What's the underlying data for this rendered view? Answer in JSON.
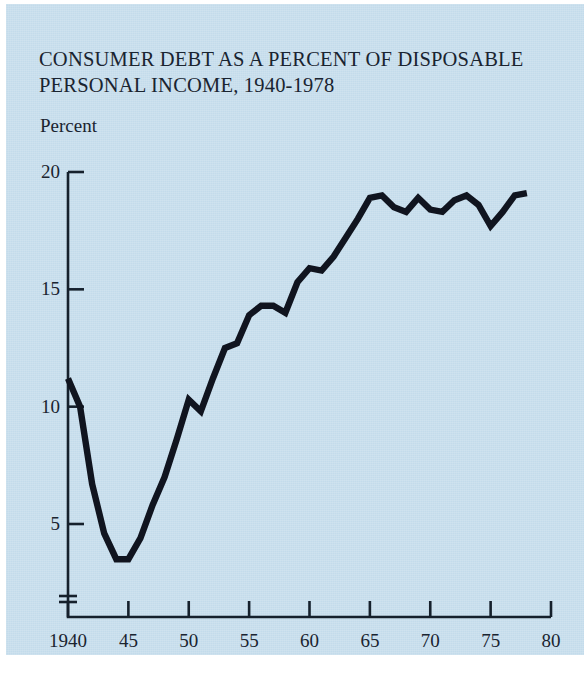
{
  "figure": {
    "title": "CONSUMER DEBT AS A PERCENT OF DISPOSABLE\nPERSONAL INCOME, 1940-1978",
    "unit_label": "Percent",
    "background_color": "#c3dbeb",
    "ink_color": "#15202c",
    "line_color": "#10141f"
  },
  "chart_data": {
    "type": "line",
    "title": "CONSUMER DEBT AS A PERCENT OF DISPOSABLE PERSONAL INCOME, 1940-1978",
    "xlabel": "",
    "ylabel": "Percent",
    "xlim": [
      1940,
      1980
    ],
    "ylim": [
      3.0,
      20
    ],
    "grid": false,
    "legend": null,
    "axis_break": true,
    "xticks": [
      1940,
      1945,
      1950,
      1955,
      1960,
      1965,
      1970,
      1975,
      1980
    ],
    "xtick_labels": [
      "1940",
      "45",
      "50",
      "55",
      "60",
      "65",
      "70",
      "75",
      "80"
    ],
    "yticks": [
      5,
      10,
      15,
      20
    ],
    "ytick_labels": [
      "5",
      "10",
      "15",
      "20"
    ],
    "series": [
      {
        "name": "Consumer debt as percent of disposable personal income",
        "x": [
          1940,
          1941,
          1942,
          1943,
          1944,
          1945,
          1946,
          1947,
          1948,
          1949,
          1950,
          1951,
          1952,
          1953,
          1954,
          1955,
          1956,
          1957,
          1958,
          1959,
          1960,
          1961,
          1962,
          1963,
          1964,
          1965,
          1966,
          1967,
          1968,
          1969,
          1970,
          1971,
          1972,
          1973,
          1974,
          1975,
          1976,
          1977,
          1978
        ],
        "values": [
          11.2,
          10.0,
          6.7,
          4.6,
          3.5,
          3.5,
          4.4,
          5.8,
          7.0,
          8.6,
          10.3,
          9.8,
          11.2,
          12.5,
          12.7,
          13.9,
          14.3,
          14.3,
          14.0,
          15.3,
          15.9,
          15.8,
          16.4,
          17.2,
          18.0,
          18.9,
          19.0,
          18.5,
          18.3,
          18.9,
          18.4,
          18.3,
          18.8,
          19.0,
          18.6,
          17.7,
          18.3,
          19.0,
          19.1
        ]
      }
    ]
  }
}
